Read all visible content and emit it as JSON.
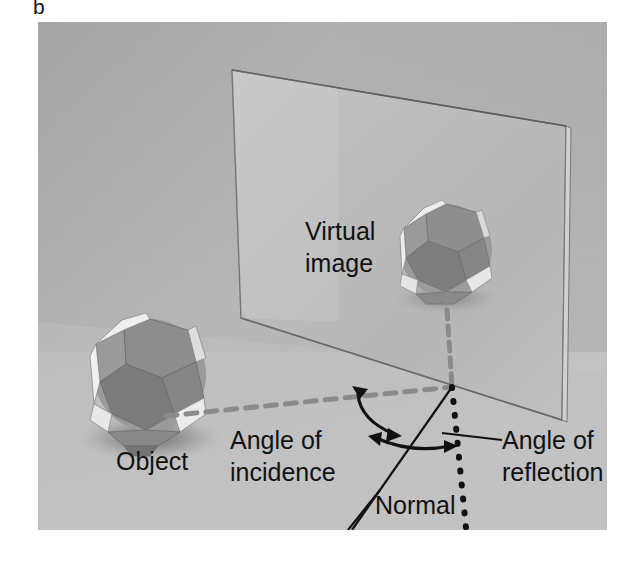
{
  "figure": {
    "panel_label": "b",
    "caption_absent": true
  },
  "photo": {
    "background_color": "#b0b0b0",
    "floor_color": "#c2c2c2",
    "wall_color": "#b4b4b4",
    "frame": {
      "x": 38,
      "y": 22,
      "width": 569,
      "height": 508
    }
  },
  "labels": {
    "virtual_image_line1": "Virtual",
    "virtual_image_line2": "image",
    "object": "Object",
    "angle_of_incidence_line1": "Angle of",
    "angle_of_incidence_line2": "incidence",
    "angle_of_reflection_line1": "Angle of",
    "angle_of_reflection_line2": "reflection",
    "normal": "Normal"
  },
  "objects": {
    "object_ball": {
      "name": "polyhedral-ball-object",
      "center_x": 150,
      "center_y": 375,
      "radius": 56
    },
    "virtual_ball": {
      "name": "polyhedral-ball-virtual-image",
      "center_x": 446,
      "center_y": 250,
      "radius": 46
    },
    "mirror": {
      "name": "plane-mirror",
      "top_left": [
        232,
        70
      ],
      "top_right": [
        566,
        126
      ],
      "bottom_right": [
        562,
        420
      ],
      "bottom_left": [
        241,
        318
      ]
    }
  },
  "rays": {
    "incident_ray": {
      "style": "gray-dashed",
      "color": "#8a8a8a",
      "from": [
        166,
        416
      ],
      "to": [
        452,
        387
      ]
    },
    "virtual_ray": {
      "style": "gray-dashed",
      "color": "#8a8a8a",
      "from": [
        446,
        294
      ],
      "to": [
        452,
        387
      ]
    },
    "normal_line": {
      "style": "black-dotted",
      "color": "#111111",
      "from": [
        452,
        387
      ],
      "to": [
        466,
        528
      ]
    },
    "reflected_ray": {
      "style": "solid-black",
      "color": "#111111",
      "from": [
        452,
        387
      ],
      "to": [
        352,
        540
      ]
    }
  },
  "annotations": {
    "angle_arc_incidence": "double-headed-curved-arrow",
    "angle_arc_reflection": "double-headed-curved-arrow",
    "reflection_leader_line": {
      "from": [
        442,
        433
      ],
      "to": [
        502,
        440
      ]
    },
    "normal_leader_line": {
      "from": [
        348,
        540
      ],
      "to": [
        378,
        498
      ]
    }
  },
  "colors": {
    "text": "#111111",
    "ray_gray": "#8a8a8a",
    "photo_bg_top": "#b4b4b4",
    "photo_bg_bottom": "#c4c4c4",
    "ball_dark_face": "#8c8c8c",
    "ball_mid_face": "#a3a3a3",
    "ball_light_face": "#e8e8e8"
  }
}
